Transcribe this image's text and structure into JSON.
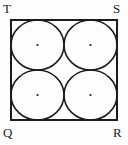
{
  "figure": {
    "background_color": "#fdfdfd",
    "stroke_color": "#1c1c1c",
    "label_color": "#1c1c1c",
    "square": {
      "name": "QRST",
      "x": 11,
      "y": 20,
      "width": 106,
      "height": 100,
      "stroke_width": 2
    },
    "circles": [
      {
        "id": "circle-top-left",
        "cx": 37.5,
        "cy": 45,
        "rx": 26.5,
        "ry": 25,
        "stroke_width": 1.6
      },
      {
        "id": "circle-top-right",
        "cx": 90.5,
        "cy": 45,
        "rx": 26.5,
        "ry": 25,
        "stroke_width": 1.6
      },
      {
        "id": "circle-bottom-left",
        "cx": 37.5,
        "cy": 95,
        "rx": 26.5,
        "ry": 25,
        "stroke_width": 1.6
      },
      {
        "id": "circle-bottom-right",
        "cx": 90.5,
        "cy": 95,
        "rx": 26.5,
        "ry": 25,
        "stroke_width": 1.6
      }
    ],
    "center_dots": [
      {
        "id": "center-dot-top-left",
        "cx": 37.5,
        "cy": 45,
        "r": 1.1
      },
      {
        "id": "center-dot-top-right",
        "cx": 90.5,
        "cy": 45,
        "r": 1.1
      },
      {
        "id": "center-dot-bottom-left",
        "cx": 37.5,
        "cy": 95,
        "r": 1.1
      },
      {
        "id": "center-dot-bottom-right",
        "cx": 90.5,
        "cy": 95,
        "r": 1.1
      }
    ],
    "labels": {
      "top_left": "T",
      "top_right": "S",
      "bottom_left": "Q",
      "bottom_right": "R"
    }
  }
}
